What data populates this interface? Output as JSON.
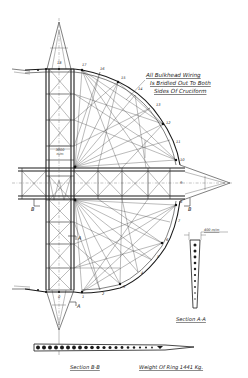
{
  "drawing": {
    "type": "structural-engineering-drawing",
    "subject": "Airship bulkhead ring with cruciform bracing",
    "annotations": {
      "bulkhead_note": [
        "All Bulkhead Wiring",
        "Is Bridled Out To Both",
        "Sides Of Cruciform"
      ],
      "dimension_center": [
        "3000",
        "m/m"
      ],
      "dimension_section_a": "400 m/m",
      "section_a_caption": "Section A-A",
      "section_b_caption": "Section B-B",
      "weight_caption": "Weight Of Ring 1441 Kg."
    },
    "section_markers": {
      "a_upper": "A",
      "a_lower": "A",
      "b_left": "B",
      "b_right": "B"
    },
    "node_labels": [
      "0",
      "1",
      "2",
      "3",
      "4",
      "5",
      "6",
      "7",
      "8",
      "9",
      "10",
      "11",
      "12",
      "13",
      "14",
      "15",
      "16",
      "17",
      "18"
    ],
    "colors": {
      "line": "#2a2a2a",
      "background": "#ffffff"
    }
  }
}
